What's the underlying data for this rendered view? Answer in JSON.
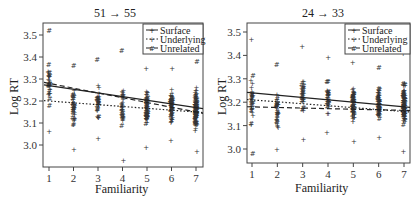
{
  "chart_data": [
    {
      "type": "scatter",
      "title": "51 → 55",
      "title_from": "51",
      "title_to": "55",
      "xlabel": "Familiarity",
      "ylabel": "Log RT",
      "x_ticks": [
        1,
        2,
        3,
        4,
        5,
        6,
        7
      ],
      "y_ticks": [
        "3.0",
        "3.1",
        "3.2",
        "3.3",
        "3.4",
        "3.5"
      ],
      "ylim": [
        2.94,
        3.55
      ],
      "xlim": [
        0.75,
        7.3
      ],
      "legend_position": "top-right",
      "series": [
        {
          "name": "Surface",
          "marker": "+",
          "line_style": "solid",
          "fit": {
            "x": [
              1,
              7
            ],
            "y": [
              3.27,
              3.17
            ]
          }
        },
        {
          "name": "Underlying",
          "marker": "+",
          "line_style": "dotted",
          "fit": {
            "x": [
              1,
              7
            ],
            "y": [
              3.2,
              3.15
            ]
          }
        },
        {
          "name": "Unrelated",
          "marker": "#",
          "line_style": "dashed",
          "fit": {
            "x": [
              1,
              7
            ],
            "y": [
              3.28,
              3.15
            ]
          }
        }
      ],
      "point_ranges": [
        {
          "x": 1,
          "min": 3.06,
          "max": 3.52
        },
        {
          "x": 2,
          "min": 2.98,
          "max": 3.36
        },
        {
          "x": 3,
          "min": 3.03,
          "max": 3.39
        },
        {
          "x": 4,
          "min": 2.93,
          "max": 3.43
        },
        {
          "x": 5,
          "min": 2.99,
          "max": 3.35
        },
        {
          "x": 6,
          "min": 3.02,
          "max": 3.35
        },
        {
          "x": 7,
          "min": 2.97,
          "max": 3.38
        }
      ]
    },
    {
      "type": "scatter",
      "title": "24 → 33",
      "title_from": "24",
      "title_to": "33",
      "xlabel": "Familiarity",
      "ylabel": "Log RT",
      "x_ticks": [
        1,
        2,
        3,
        4,
        5,
        6,
        7
      ],
      "y_ticks": [
        "3.0",
        "3.1",
        "3.2",
        "3.3",
        "3.4",
        "3.5"
      ],
      "ylim": [
        2.94,
        3.54
      ],
      "xlim": [
        0.8,
        7.25
      ],
      "legend_position": "top-right",
      "series": [
        {
          "name": "Surface",
          "marker": "+",
          "line_style": "solid",
          "fit": {
            "x": [
              1,
              7
            ],
            "y": [
              3.24,
              3.18
            ]
          }
        },
        {
          "name": "Underlying",
          "marker": "+",
          "line_style": "dotted",
          "fit": {
            "x": [
              1,
              7
            ],
            "y": [
              3.21,
              3.16
            ]
          }
        },
        {
          "name": "Unrelated",
          "marker": "#",
          "line_style": "dashed",
          "fit": {
            "x": [
              1,
              7
            ],
            "y": [
              3.18,
              3.165
            ]
          }
        }
      ],
      "point_ranges": [
        {
          "x": 1,
          "min": 2.98,
          "max": 3.47
        },
        {
          "x": 2,
          "min": 3.0,
          "max": 3.36
        },
        {
          "x": 3,
          "min": 3.04,
          "max": 3.44
        },
        {
          "x": 4,
          "min": 3.07,
          "max": 3.39
        },
        {
          "x": 5,
          "min": 3.03,
          "max": 3.37
        },
        {
          "x": 6,
          "min": 3.05,
          "max": 3.35
        },
        {
          "x": 7,
          "min": 2.99,
          "max": 3.41
        }
      ]
    }
  ],
  "panels": [
    {
      "title": "51 → 55",
      "xlabel": "Familiarity",
      "ylabel": "Log RT",
      "legend": [
        "Surface",
        "Underlying",
        "Unrelated"
      ]
    },
    {
      "title": "24 → 33",
      "xlabel": "Familiarity",
      "ylabel": "Log RT",
      "legend": [
        "Surface",
        "Underlying",
        "Unrelated"
      ]
    }
  ]
}
